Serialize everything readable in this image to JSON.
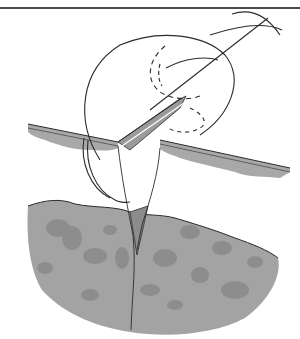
{
  "figure": {
    "header_rule": true,
    "corner_text": "",
    "colors": {
      "line": "#2b2b2b",
      "skin_shade": "#a8a8a8",
      "tissue_shade": "#9c9c9c",
      "tissue_spots": "#858585",
      "background": "#ffffff",
      "rule": "#4a4a4a"
    }
  }
}
